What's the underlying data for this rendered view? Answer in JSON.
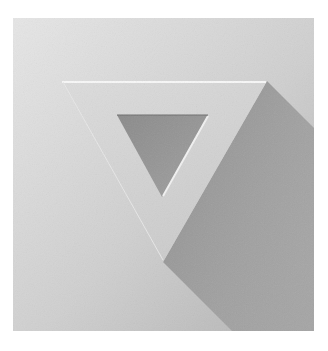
{
  "logo": {
    "shape": "inverted-triangle-frame",
    "icon_name": "triangle-down-icon",
    "square": {
      "x": 13,
      "y": 18,
      "width": 301,
      "height": 313
    },
    "outer_triangle": {
      "points": "62,81 267,81 163,262"
    },
    "inner_triangle": {
      "points": "117,115 208,115 162,197"
    },
    "shadow_polygon": {
      "points": "267,81 314,128 314,331 232,331 163,262"
    },
    "colors": {
      "background": "#ffffff",
      "square_light": "#e4e4e4",
      "square_dark": "#b4b4b4",
      "triangle_face": "#d9d9d9",
      "triangle_face_dark": "#c9c9c9",
      "top_highlight": "#f7f7f7",
      "inner_hole_light": "#9a9a9a",
      "inner_hole_dark": "#7c7c7c",
      "shadow": "#8f8f8f"
    }
  }
}
